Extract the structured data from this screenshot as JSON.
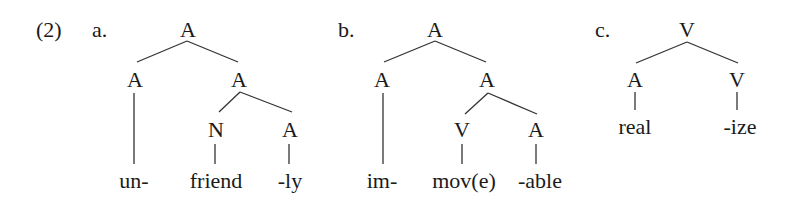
{
  "example_number": "(2)",
  "trees": [
    {
      "label": "a.",
      "root": "A",
      "left": "A",
      "right": "A",
      "right_left": "N",
      "right_right": "A",
      "leaves": [
        "un-",
        "friend",
        "-ly"
      ]
    },
    {
      "label": "b.",
      "root": "A",
      "left": "A",
      "right": "A",
      "right_left": "V",
      "right_right": "A",
      "leaves": [
        "im-",
        "mov(e)",
        "-able"
      ]
    },
    {
      "label": "c.",
      "root": "V",
      "left": "A",
      "right": "V",
      "leaves": [
        "real",
        "-ize"
      ]
    }
  ],
  "colors": {
    "ink": "#1a1a1a",
    "line": "#333333",
    "background": "#ffffff"
  }
}
